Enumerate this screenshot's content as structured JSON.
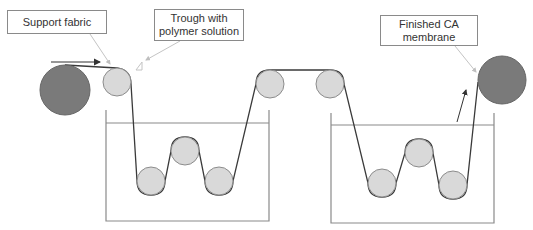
{
  "diagram": {
    "labels": {
      "support_fabric": "Support fabric",
      "trough": "Trough with\npolymer solution",
      "finished": "Finished CA\nmembrane"
    },
    "colors": {
      "dark_roll": "#7a7a7a",
      "light_roller": "#d9d9d9",
      "roller_stroke": "#8c8c8c",
      "belt": "#3a3a3a",
      "trough": "#8a8a8a",
      "leader": "#bfbfbf"
    },
    "components": [
      {
        "id": "feed-roll",
        "type": "dark roll",
        "cx": 65,
        "cy": 90,
        "r": 25
      },
      {
        "id": "guide-roller-1",
        "type": "roller",
        "cx": 117,
        "cy": 82,
        "r": 14
      },
      {
        "id": "trough-1",
        "type": "trough",
        "x": 106,
        "y": 110,
        "w": 163,
        "h": 111
      },
      {
        "id": "trough-1-roller-left",
        "type": "roller",
        "cx": 151,
        "cy": 181,
        "r": 14
      },
      {
        "id": "trough-1-roller-mid",
        "type": "roller",
        "cx": 185,
        "cy": 151,
        "r": 14
      },
      {
        "id": "trough-1-roller-right",
        "type": "roller",
        "cx": 219,
        "cy": 181,
        "r": 14
      },
      {
        "id": "guide-roller-2",
        "type": "roller",
        "cx": 270,
        "cy": 84,
        "r": 14
      },
      {
        "id": "guide-roller-3",
        "type": "roller",
        "cx": 330,
        "cy": 84,
        "r": 14
      },
      {
        "id": "trough-2",
        "type": "trough",
        "x": 331,
        "y": 113,
        "w": 163,
        "h": 110
      },
      {
        "id": "trough-2-roller-left",
        "type": "roller",
        "cx": 382,
        "cy": 183,
        "r": 14
      },
      {
        "id": "trough-2-roller-mid",
        "type": "roller",
        "cx": 419,
        "cy": 153,
        "r": 14
      },
      {
        "id": "trough-2-roller-right",
        "type": "roller",
        "cx": 453,
        "cy": 185,
        "r": 14
      },
      {
        "id": "take-up-roll",
        "type": "dark roll",
        "cx": 502,
        "cy": 80,
        "r": 24
      }
    ]
  }
}
